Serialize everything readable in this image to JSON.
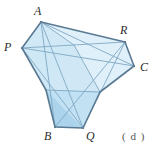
{
  "figure": {
    "caption": "( d )",
    "colors": {
      "fill_light": "#cfe8f5",
      "fill_mid": "#bfdff2",
      "fill_dark": "#a9d2ec",
      "fill_pale": "#ddeffa",
      "edge_dark": "#5a7a93",
      "edge_light": "#7fa8c4",
      "label_color": "#2b2b2b",
      "caption_color": "#555555",
      "background": "#ffffff"
    },
    "vertices": [
      {
        "name": "A",
        "label": "A",
        "x": 41,
        "y": 22,
        "label_x": 34,
        "label_y": 5
      },
      {
        "name": "P",
        "label": "P",
        "x": 22,
        "y": 48,
        "label_x": 4,
        "label_y": 41
      },
      {
        "name": "R",
        "label": "R",
        "x": 125,
        "y": 42,
        "label_x": 120,
        "label_y": 24
      },
      {
        "name": "C",
        "label": "C",
        "x": 134,
        "y": 66,
        "label_x": 140,
        "label_y": 61
      },
      {
        "name": "B",
        "label": "B",
        "x": 55,
        "y": 127,
        "label_x": 44,
        "label_y": 130
      },
      {
        "name": "Q",
        "label": "Q",
        "x": 83,
        "y": 128,
        "label_x": 86,
        "label_y": 130
      }
    ],
    "faces": [
      {
        "name": "left-flap",
        "points": "22,48 41,22 74,45 46,90"
      },
      {
        "name": "top-band",
        "points": "41,22 125,42 74,45"
      },
      {
        "name": "right-flap",
        "points": "125,42 134,66 100,92 74,45"
      },
      {
        "name": "central-face",
        "points": "22,48 74,45 100,92 55,105 46,90"
      },
      {
        "name": "bottom-flap-dark",
        "points": "46,90 83,128 55,127"
      },
      {
        "name": "bottom-flap-light",
        "points": "46,90 100,92 83,128"
      }
    ],
    "edges": [
      {
        "name": "edge-P-A",
        "from": "P",
        "to": "A",
        "weight": "heavy"
      },
      {
        "name": "edge-A-R",
        "from": "A",
        "to": "R",
        "weight": "heavy"
      },
      {
        "name": "edge-R-C",
        "from": "R",
        "to": "C",
        "weight": "heavy"
      },
      {
        "name": "edge-C-Q",
        "from": "C",
        "to": "Q",
        "weight": "heavy"
      },
      {
        "name": "edge-Q-B",
        "from": "Q",
        "to": "B",
        "weight": "heavy"
      },
      {
        "name": "edge-B-P",
        "from": "B",
        "to": "P",
        "weight": "heavy"
      },
      {
        "name": "crease-A-Q",
        "from": "A",
        "to": "Q",
        "weight": "light"
      },
      {
        "name": "crease-P-R",
        "from": "P",
        "to": "R",
        "weight": "light"
      },
      {
        "name": "crease-P-C",
        "from": "P",
        "to": "C",
        "weight": "light"
      },
      {
        "name": "crease-A-B",
        "from": "A",
        "to": "B",
        "weight": "light"
      },
      {
        "name": "crease-R-B",
        "from": "R",
        "to": "B",
        "weight": "light"
      },
      {
        "name": "crease-R-Q",
        "from": "R",
        "to": "Q",
        "weight": "light"
      },
      {
        "name": "crease-P-Q",
        "from": "P",
        "to": "Q",
        "weight": "light"
      },
      {
        "name": "crease-A-C",
        "from": "A",
        "to": "C",
        "weight": "light"
      }
    ]
  }
}
